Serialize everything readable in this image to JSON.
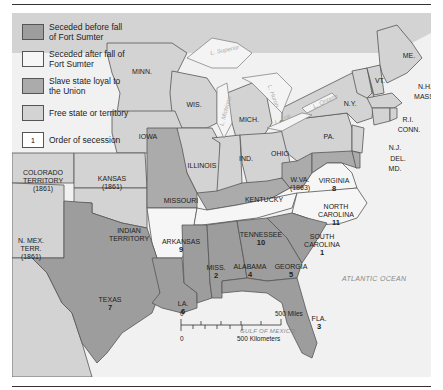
{
  "colors": {
    "seceded_before": "#9d9d9d",
    "seceded_after": "#f6f6f6",
    "slave_loyal": "#ababab",
    "free": "#d3d3d3",
    "water": "#f4f4f4",
    "border": "#555555"
  },
  "legend": {
    "items": [
      {
        "label": "Seceded before fall of Fort Sumter",
        "swatch": "seceded_before"
      },
      {
        "label": "Seceded after fall of Fort Sumter",
        "swatch": "seceded_after"
      },
      {
        "label": "Slave state loyal to the Union",
        "swatch": "slave_loyal"
      },
      {
        "label": "Free state or territory",
        "swatch": "free"
      },
      {
        "label": "Order of secession",
        "swatch": "number",
        "sample": "1"
      }
    ]
  },
  "states": {
    "minn": {
      "name": "MINN."
    },
    "wis": {
      "name": "WIS."
    },
    "mich": {
      "name": "MICH."
    },
    "iowa": {
      "name": "IOWA"
    },
    "illinois": {
      "name": "ILLINOIS"
    },
    "ind": {
      "name": "IND."
    },
    "ohio": {
      "name": "OHIO"
    },
    "pa": {
      "name": "PA."
    },
    "ny": {
      "name": "N.Y."
    },
    "vt": {
      "name": "VT."
    },
    "me": {
      "name": "ME."
    },
    "nh": {
      "name": "N.H."
    },
    "mass": {
      "name": "MASS."
    },
    "ri": {
      "name": "R.I."
    },
    "conn": {
      "name": "CONN."
    },
    "nj": {
      "name": "N.J."
    },
    "del": {
      "name": "DEL."
    },
    "md": {
      "name": "MD."
    },
    "colorado": {
      "name": "COLORADO TERRITORY",
      "year": "(1861)"
    },
    "kansas": {
      "name": "KANSAS",
      "year": "(1861)"
    },
    "missouri": {
      "name": "MISSOURI"
    },
    "kentucky": {
      "name": "KENTUCKY"
    },
    "wva": {
      "name": "W.VA.",
      "year": "(1863)"
    },
    "virginia": {
      "name": "VIRGINIA",
      "order": "8"
    },
    "nmex": {
      "name": "N. MEX. TERR.",
      "year": "(1861)"
    },
    "indian": {
      "name": "INDIAN TERRITORY"
    },
    "arkansas": {
      "name": "ARKANSAS",
      "order": "9"
    },
    "tennessee": {
      "name": "TENNESSEE",
      "order": "10"
    },
    "ncarolina": {
      "name": "NORTH CAROLINA",
      "order": "11"
    },
    "scarolina": {
      "name": "SOUTH CAROLINA",
      "order": "1"
    },
    "texas": {
      "name": "TEXAS",
      "order": "7"
    },
    "la": {
      "name": "LA.",
      "order": "6"
    },
    "miss": {
      "name": "MISS.",
      "order": "2"
    },
    "alabama": {
      "name": "ALABAMA",
      "order": "4"
    },
    "georgia": {
      "name": "GEORGIA",
      "order": "5"
    },
    "fla": {
      "name": "FLA.",
      "order": "3"
    }
  },
  "water": {
    "atlantic": "ATLANTIC OCEAN",
    "gulf": "GULF OF MEXICO",
    "superior": "L. Superior",
    "michigan": "L. Michigan",
    "huron": "L. Huron",
    "erie": "L. Erie",
    "ontario": "L. Ontario"
  },
  "scale": {
    "zero": "0",
    "miles": "500 Miles",
    "km": "500 Kilometers"
  }
}
